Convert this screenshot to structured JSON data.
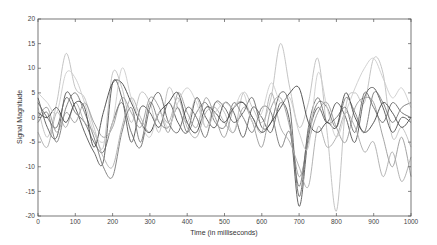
{
  "chart_data": {
    "type": "line",
    "title": "",
    "xlabel": "Time (in milliseconds)",
    "ylabel": "Signal Magnitude",
    "xlim": [
      0,
      1000
    ],
    "ylim": [
      -20,
      20
    ],
    "xticks": [
      0,
      100,
      200,
      300,
      400,
      500,
      600,
      700,
      800,
      900,
      1000
    ],
    "yticks": [
      20,
      15,
      10,
      5,
      0,
      -5,
      -10,
      -15,
      -20
    ],
    "grid": false,
    "legend": null,
    "x": [
      0,
      25,
      50,
      75,
      100,
      125,
      150,
      175,
      200,
      225,
      250,
      275,
      300,
      325,
      350,
      375,
      400,
      425,
      450,
      475,
      500,
      525,
      550,
      575,
      600,
      625,
      650,
      675,
      700,
      725,
      750,
      775,
      800,
      825,
      850,
      875,
      900,
      925,
      950,
      975,
      1000
    ],
    "series": [
      {
        "name": "signal-1",
        "color": "#bdbdbd",
        "values": [
          2,
          -4,
          3,
          13,
          6,
          4,
          -2,
          -6,
          9,
          6,
          -1,
          5,
          3,
          -3,
          6,
          2,
          -1,
          4,
          -2,
          3,
          1,
          -3,
          5,
          2,
          -1,
          4,
          15,
          6,
          -2,
          3,
          12,
          -3,
          -19,
          2,
          5,
          3,
          12,
          9,
          -4,
          -2,
          -6
        ]
      },
      {
        "name": "signal-2",
        "color": "#555555",
        "values": [
          4,
          -2,
          -4,
          5,
          2,
          -3,
          -7,
          -9,
          7,
          4,
          -5,
          2,
          1,
          -2,
          3,
          -1,
          -3,
          4,
          0,
          -2,
          3,
          1,
          -4,
          2,
          0,
          -3,
          3,
          -1,
          -18,
          -4,
          2,
          -1,
          3,
          0,
          -5,
          4,
          6,
          2,
          -3,
          0,
          -1
        ]
      },
      {
        "name": "signal-3",
        "color": "#777777",
        "values": [
          -1,
          1,
          -5,
          2,
          5,
          1,
          -4,
          -10,
          -12,
          -3,
          2,
          -5,
          3,
          -1,
          -2,
          2,
          -3,
          1,
          3,
          -1,
          -2,
          3,
          0,
          -3,
          2,
          1,
          -6,
          -3,
          -14,
          -3,
          3,
          2,
          -2,
          4,
          1,
          -3,
          5,
          3,
          -1,
          2,
          3
        ]
      },
      {
        "name": "signal-4",
        "color": "#999999",
        "values": [
          0,
          2,
          -3,
          1,
          -1,
          3,
          -1,
          -4,
          -2,
          4,
          1,
          -2,
          4,
          2,
          -3,
          5,
          1,
          -2,
          4,
          0,
          -4,
          2,
          3,
          -1,
          -6,
          2,
          4,
          -2,
          -12,
          -5,
          1,
          3,
          -2,
          -5,
          2,
          4,
          3,
          -4,
          -10,
          -4,
          -12
        ]
      },
      {
        "name": "signal-5",
        "color": "#666666",
        "values": [
          3,
          0,
          -2,
          4,
          1,
          -1,
          -5,
          -7,
          -1,
          3,
          -3,
          -6,
          2,
          5,
          -1,
          -3,
          2,
          0,
          -4,
          3,
          2,
          -1,
          1,
          4,
          -2,
          -1,
          5,
          2,
          -16,
          -2,
          4,
          -1,
          0,
          2,
          -3,
          5,
          2,
          -1,
          3,
          1,
          0
        ]
      },
      {
        "name": "signal-6",
        "color": "#aaaaaa",
        "values": [
          -3,
          -6,
          1,
          -2,
          3,
          -1,
          -3,
          -8,
          -10,
          -2,
          4,
          0,
          -3,
          1,
          -1,
          4,
          -2,
          -4,
          1,
          2,
          -1,
          -3,
          2,
          0,
          -3,
          5,
          -2,
          -5,
          -10,
          -14,
          -2,
          -6,
          -4,
          1,
          -2,
          -7,
          -5,
          -12,
          -7,
          -13,
          -8
        ]
      },
      {
        "name": "signal-7",
        "color": "#444444",
        "values": [
          1,
          0,
          2,
          -1,
          3,
          2,
          -6,
          1,
          7,
          7,
          3,
          -1,
          -3,
          1,
          3,
          5,
          -1,
          -3,
          2,
          1,
          -1,
          2,
          3,
          0,
          -3,
          -1,
          2,
          5,
          6,
          -1,
          -3,
          -1,
          -2,
          5,
          0,
          -3,
          -1,
          3,
          1,
          -2,
          0
        ]
      },
      {
        "name": "signal-8",
        "color": "#cccccc",
        "values": [
          5,
          3,
          1,
          9,
          8,
          3,
          -3,
          -5,
          -1,
          10,
          4,
          -1,
          -4,
          1,
          -2,
          3,
          6,
          3,
          -2,
          1,
          3,
          2,
          5,
          -1,
          1,
          7,
          3,
          4,
          -3,
          -6,
          9,
          2,
          -4,
          1,
          6,
          10,
          12,
          8,
          4,
          6,
          2
        ]
      }
    ]
  }
}
